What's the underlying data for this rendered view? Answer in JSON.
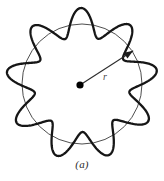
{
  "figure": {
    "caption": "(a)",
    "radius_label": "r",
    "colors": {
      "wave_stroke": "#161616",
      "circle_stroke": "#3a3a3a",
      "radius_line": "#2c2c2c",
      "center_dot": "#000000",
      "background": "#ffffff",
      "caption_text": "#2b2b2b",
      "label_text": "#4a4a4a"
    },
    "geometry": {
      "center_x": 82,
      "center_y": 84,
      "circle_radius": 60,
      "wave_mean_radius": 62,
      "wave_amplitude": 14,
      "wave_lobes": 9,
      "wave_phase_deg": 96,
      "wave_stroke_width": 2.3,
      "circle_stroke_width": 0.9,
      "center_dot_radius": 3.6,
      "radius_arrow_angle_deg": -33,
      "radius_arrow_length": 61
    }
  }
}
